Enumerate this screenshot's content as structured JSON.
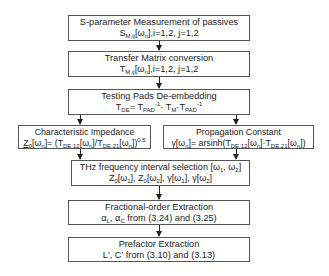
{
  "diagram": {
    "boxes": [
      {
        "id": "s-param",
        "title": "S-parameter Measurement of passives",
        "formula_parts": {
          "base": "S",
          "sub": "M,ij",
          "rest": "[ω",
          "rest_sub": "n",
          "tail": "],i=1,2, j=1,2"
        }
      },
      {
        "id": "transfer",
        "title": "Transfer Matrix conversion",
        "formula_parts": {
          "base": "T",
          "sub": "M,ij",
          "rest": "[ω",
          "rest_sub": "n",
          "tail": "],i=1,2, j=1,2"
        }
      },
      {
        "id": "deembed",
        "title": "Testing Pads De-embedding",
        "formula": "TDE= TPAD-1· TM·TPAD-1",
        "formula_parts": {
          "a": "T",
          "a_sub": "DE",
          "b": "= T",
          "b_sub": "PAD",
          "b_sup": "-1",
          "c": "· T",
          "c_sub": "M",
          "d": "·T",
          "d_sub": "PAD",
          "d_sup": "-1"
        }
      },
      {
        "id": "impedance",
        "title": "Characteristic Impedance",
        "formula_parts": {
          "a": "Z",
          "a_sub": "0",
          "b": "[ω",
          "b_sub": "n",
          "c": "]= (T",
          "c_sub": "DE,12",
          "d": "[ω",
          "d_sub": "n",
          "e": "]/T",
          "e_sub": "DE,21",
          "f": "[ω",
          "f_sub": "n",
          "g": "])",
          "g_sup": "0.5"
        }
      },
      {
        "id": "propagation",
        "title": "Propagation Constant",
        "formula_parts": {
          "a": "γ[ω",
          "a_sub": "n",
          "b": "]= arsinh(T",
          "b_sub": "DE,12",
          "c": "[ω",
          "c_sub": "n",
          "d": "]·T",
          "d_sub": "DE,21",
          "e": "[ω",
          "e_sub": "n",
          "f": "])"
        }
      },
      {
        "id": "thz",
        "title_parts": {
          "a": "THz frequency interval selection [ω",
          "a_sub": "1",
          "b": ", ω",
          "b_sub": "2",
          "c": "]"
        },
        "formula_parts": {
          "a": "Z",
          "a_sub": "0",
          "b": "[ω",
          "b_sub": "1",
          "c": "], Z",
          "c_sub": "0",
          "d": "[ω",
          "d_sub": "2",
          "e": "], γ[ω",
          "e_sub": "1",
          "f": "], γ[ω",
          "f_sub": "2",
          "g": "]"
        }
      },
      {
        "id": "fractional",
        "title": "Fractional-order Extraction",
        "formula_parts": {
          "a": "α",
          "a_sub": "L",
          "b": ", α",
          "b_sub": "C",
          "c": " from (3.24) and (3.25)"
        }
      },
      {
        "id": "prefactor",
        "title": "Prefactor Extraction",
        "formula": "L', C' from (3.10) and (3.13)"
      }
    ],
    "colors": {
      "border": "#555555",
      "arrow": "#222222",
      "text": "#222222",
      "background": "#ffffff"
    }
  }
}
